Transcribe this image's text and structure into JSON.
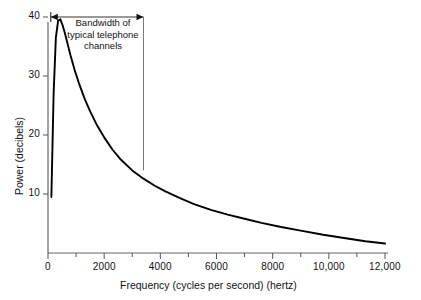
{
  "chart_data": {
    "type": "line",
    "title": "",
    "xlabel": "Frequency (cycles per second) (hertz)",
    "ylabel": "Power (decibels)",
    "xlim": [
      0,
      12000
    ],
    "ylim": [
      0,
      48
    ],
    "grid": false,
    "legend": null,
    "x_ticks": [
      0,
      2000,
      4000,
      6000,
      8000,
      10000,
      12000
    ],
    "x_tick_labels": [
      "0",
      "2000",
      "4000",
      "6000",
      "8000",
      "10,000",
      "12,000"
    ],
    "x_minor_ticks": [
      1000,
      3000,
      5000,
      7000,
      9000,
      11000
    ],
    "y_ticks": [
      10,
      20,
      30,
      40
    ],
    "y_tick_labels": [
      "10",
      "20",
      "30",
      "40"
    ],
    "series": [
      {
        "name": "speech power spectrum",
        "x": [
          120,
          200,
          280,
          360,
          440,
          520,
          600,
          700,
          800,
          950,
          1100,
          1300,
          1500,
          1750,
          2000,
          2300,
          2600,
          3000,
          3400,
          3800,
          4200,
          4700,
          5200,
          5800,
          6400,
          7000,
          7600,
          8300,
          9000,
          9800,
          10600,
          11300,
          12000
        ],
        "y": [
          9.5,
          27.0,
          36.5,
          39.4,
          39.6,
          38.6,
          37.3,
          35.4,
          33.5,
          31.0,
          28.8,
          26.2,
          24.0,
          21.6,
          19.6,
          17.5,
          15.8,
          14.0,
          12.6,
          11.4,
          10.4,
          9.3,
          8.3,
          7.3,
          6.5,
          5.8,
          5.1,
          4.4,
          3.8,
          3.1,
          2.5,
          2.0,
          1.6
        ]
      }
    ],
    "annotations": [
      {
        "name": "bandwidth-annotation",
        "text_lines": [
          "Bandwidth of",
          "typical telephone",
          "channels"
        ],
        "arrow_from_hz": 100,
        "arrow_to_hz": 3400,
        "arrow_at_db": 40,
        "dropline_from_db": 40,
        "dropline_to_db": 14
      }
    ]
  },
  "annotation": {
    "line1": "Bandwidth of",
    "line2": "typical telephone",
    "line3": "channels"
  },
  "axes": {
    "x_label": "Frequency (cycles per second) (hertz)",
    "y_label": "Power (decibels)",
    "x_tick_0": "0",
    "x_tick_2000": "2000",
    "x_tick_4000": "4000",
    "x_tick_6000": "6000",
    "x_tick_8000": "8000",
    "x_tick_10000": "10,000",
    "x_tick_12000": "12,000",
    "y_tick_10": "10",
    "y_tick_20": "20",
    "y_tick_30": "30",
    "y_tick_40": "40"
  },
  "colors": {
    "curve": "#000000",
    "axis": "#555555",
    "text": "#111111",
    "background": "#ffffff"
  }
}
